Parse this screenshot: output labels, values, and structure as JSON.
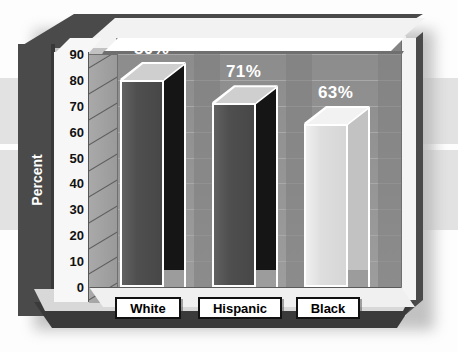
{
  "chart_data": {
    "type": "bar",
    "title": "",
    "xlabel": "",
    "ylabel": "Percent",
    "categories": [
      "White",
      "Hispanic",
      "Black"
    ],
    "values": [
      80,
      71,
      63
    ],
    "value_labels": [
      "80%",
      "71%",
      "63%"
    ],
    "ylim": [
      0,
      90
    ],
    "ytick_labels": [
      "90",
      "80",
      "70",
      "60",
      "50",
      "40",
      "30",
      "20",
      "10",
      "0"
    ],
    "ytick_values": [
      90,
      80,
      70,
      60,
      50,
      40,
      30,
      20,
      10,
      0
    ],
    "grid": true,
    "legend": "none",
    "style": "3d-bar",
    "bar_colors": [
      "#4f4f4f",
      "#4f4f4f",
      "#dedede"
    ],
    "bar_side_colors": [
      "#151515",
      "#151515",
      "#c2c2c2"
    ],
    "bar_top_colors": [
      "#cfcfcf",
      "#cfcfcf",
      "#f2f2f2"
    ],
    "plot_background": "#959595",
    "frame_color": "#4a4a4a"
  },
  "axis": {
    "title": "Percent"
  }
}
